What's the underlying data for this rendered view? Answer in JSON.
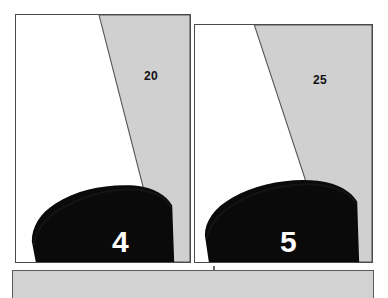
{
  "figure": {
    "background_color": "#ffffff",
    "panels": [
      {
        "id": "panel-4",
        "number_label": "4",
        "angle_label": "20",
        "wedge_color": "#d0d0d0",
        "object_color": "#0a0a0a",
        "background_color": "#ffffff",
        "border_color": "#4a4a4a",
        "geometry": {
          "x": 15,
          "y": 14,
          "width": 176,
          "height": 249,
          "wedge_top_start_x": 84,
          "wedge_bottom_x": 148,
          "object_apex_y": 175
        }
      },
      {
        "id": "panel-5",
        "number_label": "5",
        "angle_label": "25",
        "wedge_color": "#d0d0d0",
        "object_color": "#0a0a0a",
        "background_color": "#ffffff",
        "border_color": "#4a4a4a",
        "geometry": {
          "x": 194,
          "y": 24,
          "width": 179,
          "height": 239,
          "wedge_top_start_x": 60,
          "wedge_bottom_x": 139,
          "object_apex_y": 160
        }
      }
    ],
    "bottom_panel": {
      "name": "bottom-gray-bar",
      "color": "#d2d2d2",
      "border_color": "#5a5a5a"
    }
  }
}
